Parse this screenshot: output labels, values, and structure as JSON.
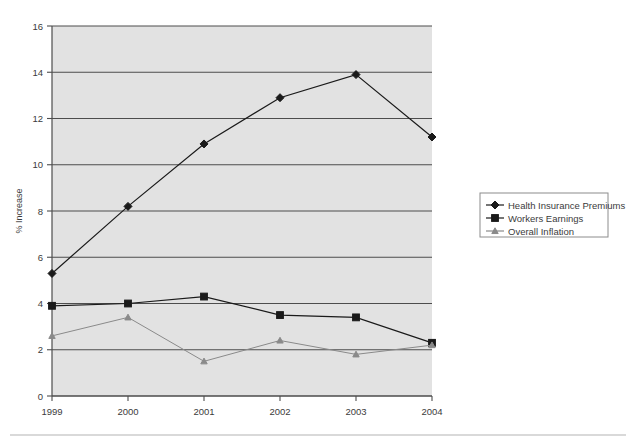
{
  "chart_data": {
    "type": "line",
    "title": "",
    "xlabel": "",
    "ylabel": "% Increase",
    "categories": [
      "1999",
      "2000",
      "2001",
      "2002",
      "2003",
      "2004"
    ],
    "xlim": [
      1999,
      2004
    ],
    "ylim": [
      0,
      16
    ],
    "ytick_step": 2,
    "yticks": [
      "0",
      "2",
      "4",
      "6",
      "8",
      "10",
      "12",
      "14",
      "16"
    ],
    "grid": true,
    "legend_position": "right-middle",
    "series": [
      {
        "name": "Health Insurance Premiums",
        "marker": "diamond",
        "color": "#1a1a1a",
        "values": [
          5.3,
          8.2,
          10.9,
          12.9,
          13.9,
          11.2
        ]
      },
      {
        "name": "Workers Earnings",
        "marker": "square",
        "color": "#1a1a1a",
        "values": [
          3.9,
          4.0,
          4.3,
          3.5,
          3.4,
          2.3
        ]
      },
      {
        "name": "Overall Inflation",
        "marker": "triangle",
        "color": "#8a8a8a",
        "values": [
          2.6,
          3.4,
          1.5,
          2.4,
          1.8,
          2.2
        ]
      }
    ]
  },
  "axis": {
    "ylabel": "% Increase",
    "yticks": [
      "16",
      "14",
      "12",
      "10",
      "8",
      "6",
      "4",
      "2",
      "0"
    ],
    "xticks": [
      "1999",
      "2000",
      "2001",
      "2002",
      "2003",
      "2004"
    ]
  },
  "legend": {
    "items": [
      {
        "label": "Health Insurance Premiums",
        "marker": "diamond-marker"
      },
      {
        "label": "Workers Earnings",
        "marker": "square-marker"
      },
      {
        "label": "Overall Inflation",
        "marker": "triangle-marker"
      }
    ]
  },
  "colors": {
    "plot_background": "#e2e2e2",
    "gridline": "#4d4d4d",
    "series_dark": "#1a1a1a",
    "series_light": "#8a8a8a",
    "legend_border": "#8c8c8c",
    "footer_rule": "#d9d9d9"
  }
}
